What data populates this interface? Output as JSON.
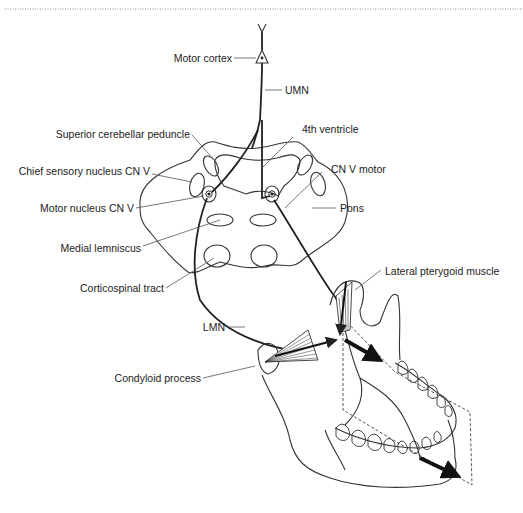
{
  "labels": {
    "motor_cortex": "Motor cortex",
    "umn": "UMN",
    "superior_cerebellar_peduncle": "Superior cerebellar peduncle",
    "fourth_ventricle": "4th ventricle",
    "chief_sensory_nucleus": "Chief sensory nucleus CN V",
    "cn_v_motor": "CN V motor",
    "motor_nucleus": "Motor nucleus CN V",
    "pons": "Pons",
    "medial_lemniscus": "Medial lemniscus",
    "corticospinal_tract": "Corticospinal tract",
    "lateral_pterygoid": "Lateral pterygoid muscle",
    "lmn": "LMN",
    "condyloid_process": "Condyloid process"
  }
}
